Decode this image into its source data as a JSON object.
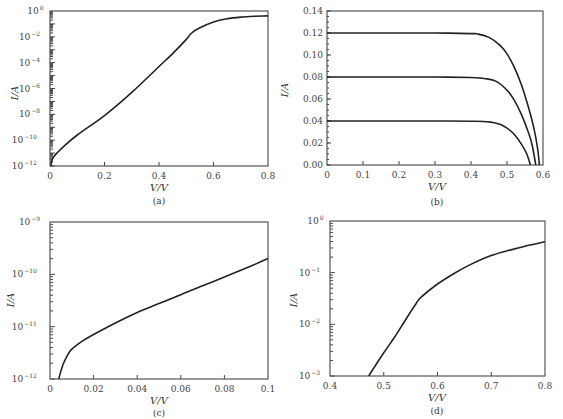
{
  "chart_data": [
    {
      "panel": "a",
      "caption": "(a)",
      "type": "line",
      "xlabel": "V/V",
      "ylabel": "I/A",
      "yscale": "log",
      "xlim": [
        0,
        0.8
      ],
      "ylim": [
        1e-12,
        1
      ],
      "xticks": [
        "0",
        "0.2",
        "0.4",
        "0.6",
        "0.8"
      ],
      "yticks": [
        "10^-12",
        "10^-10",
        "10^-8",
        "10^-6",
        "10^-4",
        "10^-2",
        "10^0"
      ],
      "grid": false,
      "series": [
        {
          "name": "I-V (log)",
          "x": [
            0.003,
            0.01,
            0.03,
            0.05,
            0.1,
            0.2,
            0.3,
            0.4,
            0.45,
            0.5,
            0.52,
            0.55,
            0.6,
            0.65,
            0.7,
            0.75,
            0.8
          ],
          "log10_y": [
            -12,
            -11.4,
            -10.9,
            -10.5,
            -9.6,
            -8.1,
            -6.3,
            -4.3,
            -3.3,
            -2.2,
            -1.7,
            -1.3,
            -0.85,
            -0.6,
            -0.47,
            -0.4,
            -0.38
          ]
        }
      ]
    },
    {
      "panel": "b",
      "caption": "(b)",
      "type": "line",
      "xlabel": "V/V",
      "ylabel": "I/A",
      "xlim": [
        0,
        0.6
      ],
      "ylim": [
        0,
        0.14
      ],
      "xticks": [
        "0",
        "0.1",
        "0.2",
        "0.3",
        "0.4",
        "0.5",
        "0.6"
      ],
      "yticks": [
        "0.00",
        "0.02",
        "0.04",
        "0.06",
        "0.08",
        "0.10",
        "0.12",
        "0.14"
      ],
      "grid": false,
      "series": [
        {
          "name": "Isc=0.12",
          "x": [
            0,
            0.1,
            0.2,
            0.3,
            0.4,
            0.42,
            0.45,
            0.48,
            0.5,
            0.52,
            0.54,
            0.56,
            0.575,
            0.585,
            0.59
          ],
          "y": [
            0.12,
            0.12,
            0.12,
            0.12,
            0.1195,
            0.119,
            0.116,
            0.109,
            0.101,
            0.089,
            0.073,
            0.052,
            0.033,
            0.015,
            0.0
          ]
        },
        {
          "name": "Isc=0.08",
          "x": [
            0,
            0.1,
            0.2,
            0.3,
            0.4,
            0.44,
            0.47,
            0.5,
            0.52,
            0.54,
            0.56,
            0.57,
            0.58
          ],
          "y": [
            0.08,
            0.08,
            0.08,
            0.08,
            0.0795,
            0.0785,
            0.076,
            0.068,
            0.059,
            0.046,
            0.029,
            0.018,
            0.0
          ]
        },
        {
          "name": "Isc=0.04",
          "x": [
            0,
            0.1,
            0.2,
            0.3,
            0.4,
            0.45,
            0.48,
            0.5,
            0.52,
            0.54,
            0.555,
            0.565
          ],
          "y": [
            0.04,
            0.04,
            0.04,
            0.04,
            0.0398,
            0.0392,
            0.037,
            0.0335,
            0.028,
            0.019,
            0.01,
            0.0
          ]
        }
      ]
    },
    {
      "panel": "c",
      "caption": "(c)",
      "type": "line",
      "xlabel": "V/V",
      "ylabel": "I/A",
      "yscale": "log",
      "xlim": [
        0,
        0.1
      ],
      "ylim": [
        1e-12,
        1e-09
      ],
      "xticks": [
        "0",
        "0.02",
        "0.04",
        "0.06",
        "0.08",
        "0.1"
      ],
      "yticks": [
        "10^-12",
        "10^-11",
        "10^-10",
        "10^-9"
      ],
      "grid": false,
      "series": [
        {
          "name": "I-V low bias",
          "x": [
            0.004,
            0.006,
            0.008,
            0.01,
            0.015,
            0.02,
            0.03,
            0.04,
            0.05,
            0.06,
            0.07,
            0.08,
            0.09,
            0.1
          ],
          "log10_y": [
            -12,
            -11.72,
            -11.55,
            -11.43,
            -11.27,
            -11.15,
            -10.93,
            -10.73,
            -10.56,
            -10.39,
            -10.22,
            -10.05,
            -9.88,
            -9.7
          ]
        }
      ]
    },
    {
      "panel": "d",
      "caption": "(d)",
      "type": "line",
      "xlabel": "V/V",
      "ylabel": "I/A",
      "yscale": "log",
      "xlim": [
        0.4,
        0.8
      ],
      "ylim": [
        0.001,
        1
      ],
      "xticks": [
        "0.4",
        "0.5",
        "0.6",
        "0.7",
        "0.8"
      ],
      "yticks": [
        "10^-3",
        "10^-2",
        "10^-1",
        "10^0"
      ],
      "grid": false,
      "series": [
        {
          "name": "I-V high bias",
          "x": [
            0.472,
            0.5,
            0.52,
            0.54,
            0.56,
            0.57,
            0.6,
            0.63,
            0.66,
            0.7,
            0.75,
            0.8
          ],
          "log10_y": [
            -3,
            -2.55,
            -2.25,
            -1.92,
            -1.6,
            -1.47,
            -1.22,
            -1.02,
            -0.85,
            -0.67,
            -0.52,
            -0.4
          ]
        }
      ]
    }
  ],
  "labels": {
    "a": {
      "caption": "(a)",
      "xlabel": "V/V",
      "ylabel": "I/A",
      "xticks": [
        "0",
        "0.2",
        "0.4",
        "0.6",
        "0.8"
      ],
      "yticks": [
        {
          "base": "10",
          "exp": "0"
        },
        {
          "base": "10",
          "exp": "−2"
        },
        {
          "base": "10",
          "exp": "−4"
        },
        {
          "base": "10",
          "exp": "−6"
        },
        {
          "base": "10",
          "exp": "−8"
        },
        {
          "base": "10",
          "exp": "−10"
        },
        {
          "base": "10",
          "exp": "−12"
        }
      ]
    },
    "b": {
      "caption": "(b)",
      "xlabel": "V/V",
      "ylabel": "I/A",
      "xticks": [
        "0",
        "0.1",
        "0.2",
        "0.3",
        "0.4",
        "0.5",
        "0.6"
      ],
      "yticks": [
        "0.14",
        "0.12",
        "0.10",
        "0.08",
        "0.06",
        "0.04",
        "0.02",
        "0.00"
      ]
    },
    "c": {
      "caption": "(c)",
      "xlabel": "V/V",
      "ylabel": "I/A",
      "xticks": [
        "0",
        "0.02",
        "0.04",
        "0.06",
        "0.08",
        "0.1"
      ],
      "yticks": [
        {
          "base": "10",
          "exp": "−9"
        },
        {
          "base": "10",
          "exp": "−10"
        },
        {
          "base": "10",
          "exp": "−11"
        },
        {
          "base": "10",
          "exp": "−12"
        }
      ]
    },
    "d": {
      "caption": "(d)",
      "xlabel": "V/V",
      "ylabel": "I/A",
      "xticks": [
        "0.4",
        "0.5",
        "0.6",
        "0.7",
        "0.8"
      ],
      "yticks": [
        {
          "base": "10",
          "exp": "0"
        },
        {
          "base": "10",
          "exp": "−1"
        },
        {
          "base": "10",
          "exp": "−2"
        },
        {
          "base": "10",
          "exp": "−3"
        }
      ]
    }
  }
}
